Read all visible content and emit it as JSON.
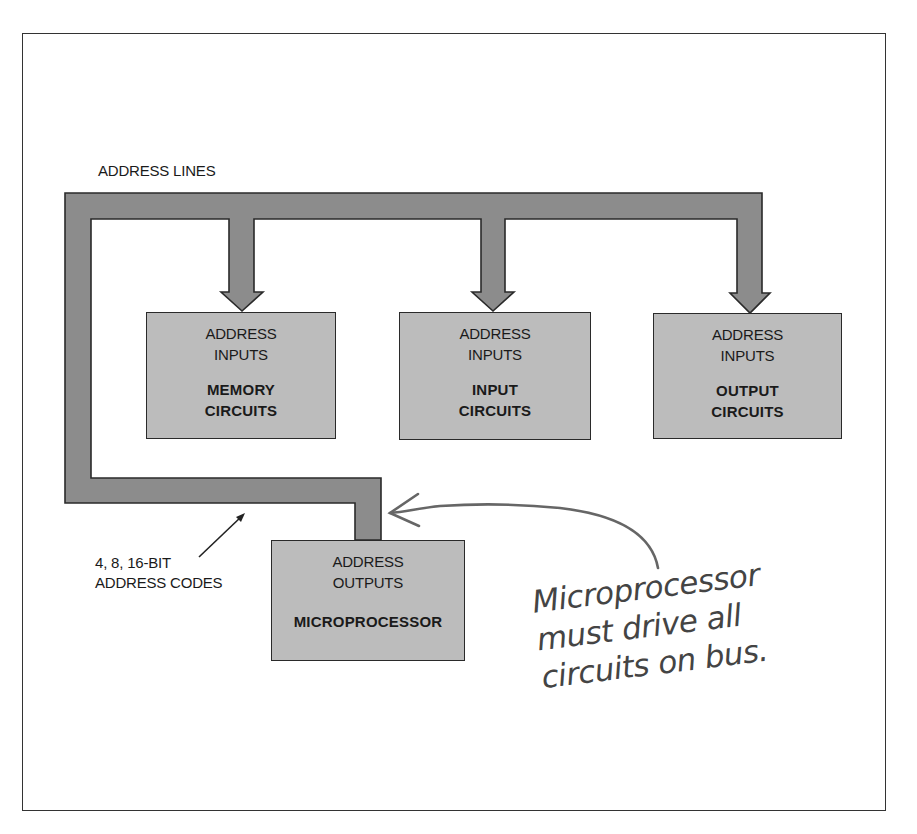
{
  "diagram": {
    "bus_label": "ADDRESS LINES",
    "bus_width_label": {
      "line1": "4, 8, 16-BIT",
      "line2": "ADDRESS CODES"
    },
    "boxes": [
      {
        "id": "memory",
        "sub1": "ADDRESS",
        "sub2": "INPUTS",
        "main1": "MEMORY",
        "main2": "CIRCUITS"
      },
      {
        "id": "input",
        "sub1": "ADDRESS",
        "sub2": "INPUTS",
        "main1": "INPUT",
        "main2": "CIRCUITS"
      },
      {
        "id": "output",
        "sub1": "ADDRESS",
        "sub2": "INPUTS",
        "main1": "OUTPUT",
        "main2": "CIRCUITS"
      },
      {
        "id": "microprocessor",
        "sub1": "ADDRESS",
        "sub2": "OUTPUTS",
        "main1": "MICROPROCESSOR",
        "main2": ""
      }
    ],
    "handwritten_note": {
      "line1": "Microprocessor",
      "line2": "must drive all",
      "line3": "circuits on bus."
    },
    "colors": {
      "bus": "#8c8c8c",
      "box": "#bcbcbc",
      "outline": "#2a2a2a",
      "note": "#555555"
    }
  }
}
